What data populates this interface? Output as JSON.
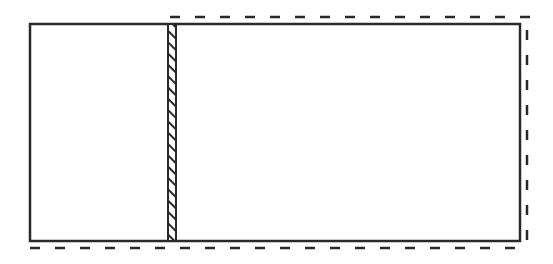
{
  "diagram": {
    "canvas": {
      "width": 553,
      "height": 264,
      "background": "#ffffff"
    },
    "colors": {
      "stroke": "#2a2a2a",
      "hatch": "#2a2a2a",
      "fill": "#ffffff"
    },
    "outer_rectangle": {
      "x": 30,
      "y": 24,
      "width": 490,
      "height": 217,
      "stroke_width": 2.5
    },
    "hatched_strip": {
      "x": 168,
      "y": 24,
      "width": 8,
      "height": 217
    },
    "dashed_outline": {
      "top": {
        "x1": 170,
        "y1": 17,
        "x2": 530,
        "y2": 17
      },
      "right": {
        "x1": 527,
        "y1": 30,
        "x2": 527,
        "y2": 250
      },
      "bottom": {
        "x1": 30,
        "y1": 248,
        "x2": 516,
        "y2": 248
      },
      "dash_pattern": "10 15",
      "stroke_width": 2.5
    },
    "labels": []
  }
}
